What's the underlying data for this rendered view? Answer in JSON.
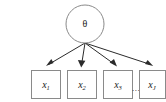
{
  "diagram": {
    "type": "directed-graphical-model",
    "background_color": "#ffffff",
    "node_border_color": "#8a8a8a",
    "node_fill_color": "#ffffff",
    "edge_color": "#2b2b2b",
    "label_color": "#1a1a1a",
    "parent": {
      "id": "theta",
      "label": "θ",
      "shape": "circle",
      "cx": 85,
      "cy": 24,
      "r": 19
    },
    "children": [
      {
        "id": "x1",
        "base": "x",
        "subscript": "1",
        "shape": "rect",
        "x": 31,
        "y": 70,
        "width": 30,
        "height": 29
      },
      {
        "id": "x2",
        "base": "x",
        "subscript": "2",
        "shape": "rect",
        "x": 67,
        "y": 70,
        "width": 30,
        "height": 29
      },
      {
        "id": "x3",
        "base": "x",
        "subscript": "3",
        "shape": "rect",
        "x": 103,
        "y": 70,
        "width": 30,
        "height": 29
      },
      {
        "id": "xJ",
        "base": "x",
        "subscript": "J",
        "shape": "rect",
        "x": 139,
        "y": 70,
        "width": 30,
        "height": 29
      }
    ],
    "ellipsis": {
      "label": "...",
      "x": 124,
      "y": 88
    },
    "edges": [
      {
        "id": "edge-theta-x1",
        "from": "theta",
        "to": "x1"
      },
      {
        "id": "edge-theta-x2",
        "from": "theta",
        "to": "x2"
      },
      {
        "id": "edge-theta-x3",
        "from": "theta",
        "to": "x3"
      },
      {
        "id": "edge-theta-xJ",
        "from": "theta",
        "to": "xJ"
      }
    ]
  }
}
